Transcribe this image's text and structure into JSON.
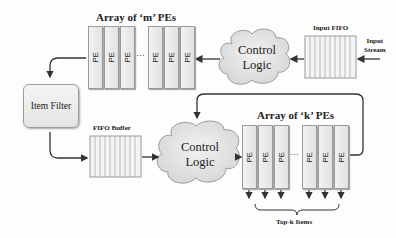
{
  "diagram": {
    "top_array": {
      "title": "Array of ‘m’ PEs",
      "pe_label": "PE",
      "dots": "···"
    },
    "bottom_array": {
      "title": "Array of ‘k’ PEs",
      "pe_label": "PE",
      "dots": "···"
    },
    "control_top": {
      "line1": "Control",
      "line2": "Logic"
    },
    "control_bottom": {
      "line1": "Control",
      "line2": "Logic"
    },
    "input_fifo": {
      "label": "Input FIFO"
    },
    "input_stream": {
      "line1": "Input",
      "line2": "Stream"
    },
    "item_filter": {
      "label": "Item Filter"
    },
    "fifo_buffer": {
      "label": "FIFO Buffer"
    },
    "output": {
      "label": "Top-k Items"
    }
  }
}
